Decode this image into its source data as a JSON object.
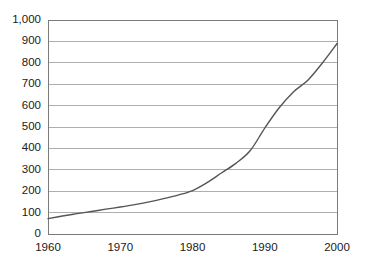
{
  "chart_data": {
    "type": "line",
    "title": "",
    "subtitle": "",
    "xlabel": "",
    "ylabel": "",
    "xlim": [
      1960,
      2000
    ],
    "ylim": [
      0,
      1000
    ],
    "grid": true,
    "grid_axis": "y",
    "legend": false,
    "legend_position": "none",
    "line_color": "#555555",
    "grid_color": "#9a9a9a",
    "frame_color": "#7a7a7a",
    "background": "#ffffff",
    "x_tick_labels": [
      "1960",
      "1970",
      "1980",
      "1990",
      "2000"
    ],
    "x_ticks": [
      1960,
      1970,
      1980,
      1990,
      2000
    ],
    "y_tick_labels": [
      "0",
      "100",
      "200",
      "300",
      "400",
      "500",
      "600",
      "700",
      "800",
      "900",
      "1,000"
    ],
    "y_ticks": [
      0,
      100,
      200,
      300,
      400,
      500,
      600,
      700,
      800,
      900,
      1000
    ],
    "series": [
      {
        "name": "value",
        "x": [
          1960,
          1962,
          1964,
          1966,
          1968,
          1970,
          1972,
          1974,
          1976,
          1978,
          1980,
          1982,
          1984,
          1986,
          1988,
          1990,
          1992,
          1994,
          1996,
          1998,
          2000
        ],
        "values": [
          72,
          84,
          95,
          105,
          116,
          126,
          137,
          150,
          165,
          182,
          203,
          240,
          285,
          330,
          390,
          495,
          590,
          665,
          720,
          800,
          890
        ]
      }
    ]
  },
  "axes": {
    "plot_left_px": 48,
    "plot_right_px": 337,
    "plot_top_px": 20,
    "plot_bottom_px": 234
  }
}
